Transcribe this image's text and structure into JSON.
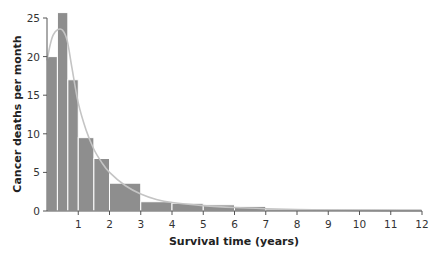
{
  "chart_data": {
    "type": "bar",
    "title": "",
    "xlabel": "Survival time (years)",
    "ylabel": "Cancer deaths per month",
    "xlim": [
      0,
      12
    ],
    "ylim": [
      0,
      25
    ],
    "x_ticks": [
      1,
      2,
      3,
      4,
      5,
      6,
      7,
      8,
      9,
      10,
      11,
      12
    ],
    "y_ticks": [
      0,
      5,
      10,
      15,
      20,
      25
    ],
    "grid": false,
    "legend": null,
    "bins": [
      {
        "start": 0,
        "end": 0.333,
        "value": 20
      },
      {
        "start": 0.333,
        "end": 0.667,
        "value": 25.7
      },
      {
        "start": 0.667,
        "end": 1,
        "value": 17
      },
      {
        "start": 1,
        "end": 1.5,
        "value": 9.5
      },
      {
        "start": 1.5,
        "end": 2,
        "value": 6.8
      },
      {
        "start": 2,
        "end": 3,
        "value": 3.6
      },
      {
        "start": 3,
        "end": 4,
        "value": 1.2
      },
      {
        "start": 4,
        "end": 5,
        "value": 1.0
      },
      {
        "start": 5,
        "end": 6,
        "value": 0.8
      },
      {
        "start": 6,
        "end": 7,
        "value": 0.6
      },
      {
        "start": 7,
        "end": 12,
        "value": 0.25
      }
    ],
    "curve": {
      "name": "fitted density",
      "points": [
        [
          0,
          19.5
        ],
        [
          0.1,
          21.5
        ],
        [
          0.2,
          22.8
        ],
        [
          0.35,
          23.5
        ],
        [
          0.5,
          23.4
        ],
        [
          0.65,
          22
        ],
        [
          0.8,
          18.5
        ],
        [
          1,
          14
        ],
        [
          1.25,
          10.5
        ],
        [
          1.5,
          8
        ],
        [
          1.75,
          6.3
        ],
        [
          2,
          5
        ],
        [
          2.5,
          3.3
        ],
        [
          3,
          2.2
        ],
        [
          3.5,
          1.5
        ],
        [
          4,
          1.1
        ],
        [
          5,
          0.7
        ],
        [
          6,
          0.45
        ],
        [
          7,
          0.3
        ],
        [
          8,
          0.2
        ],
        [
          9,
          0.13
        ],
        [
          10,
          0.08
        ],
        [
          11,
          0.05
        ],
        [
          12,
          0.03
        ]
      ]
    },
    "colors": {
      "bar": "#8e8e8e",
      "bar_separator": "#ffffff",
      "curve": "#c4c4c4",
      "axis": "#555555"
    }
  }
}
